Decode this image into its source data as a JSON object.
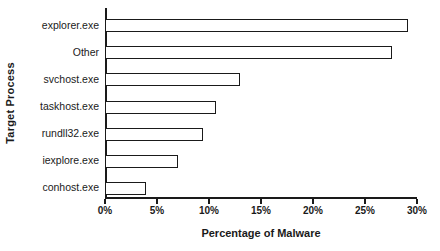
{
  "chart_data": {
    "type": "bar",
    "orientation": "horizontal",
    "title": "",
    "xlabel": "Percentage of Malware",
    "ylabel": "Target Process",
    "categories": [
      "explorer.exe",
      "Other",
      "svchost.exe",
      "taskhost.exe",
      "rundll32.exe",
      "iexplore.exe",
      "conhost.exe"
    ],
    "values": [
      29.1,
      27.6,
      13.0,
      10.7,
      9.4,
      7.0,
      3.9
    ],
    "value_labels": [
      "29.1%",
      "27.6%",
      "13.0%",
      "10.7%",
      "9.4%",
      "7.0%",
      "3.9%"
    ],
    "xlim": [
      0,
      30
    ],
    "xticks": [
      0,
      5,
      10,
      15,
      20,
      25,
      30
    ],
    "xtick_labels": [
      "0%",
      "5%",
      "10%",
      "15%",
      "20%",
      "25%",
      "30%"
    ],
    "grid": false,
    "legend": null,
    "bar_fill_color": "#ffffff",
    "bar_edge_color": "#1a1a1a",
    "axis_color": "#1a1a1a",
    "background_color": "#ffffff"
  }
}
